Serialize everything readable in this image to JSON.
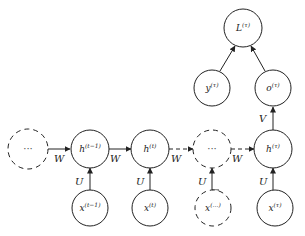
{
  "diagram": {
    "nodes": {
      "h_prev_dots": {
        "label": "···",
        "style": "dashed"
      },
      "h_tm1": {
        "base": "h",
        "sup": "(t−1)"
      },
      "h_t": {
        "base": "h",
        "sup": "(t)"
      },
      "h_dots": {
        "label": "···",
        "style": "dashed"
      },
      "h_tau": {
        "base": "h",
        "sup": "(τ)"
      },
      "x_tm1": {
        "base": "x",
        "sup": "(t−1)"
      },
      "x_t": {
        "base": "x",
        "sup": "(t)"
      },
      "x_dots": {
        "base": "x",
        "sup": "(…)",
        "style": "dashed"
      },
      "x_tau": {
        "base": "x",
        "sup": "(τ)"
      },
      "o_tau": {
        "base": "o",
        "sup": "(τ)"
      },
      "y_tau": {
        "base": "y",
        "sup": "(τ)"
      },
      "L_tau": {
        "base": "L",
        "sup": "(τ)"
      }
    },
    "edge_labels": {
      "W": "W",
      "U": "U",
      "V": "V"
    },
    "colors": {
      "stroke": "#222222",
      "background": "#ffffff"
    }
  }
}
